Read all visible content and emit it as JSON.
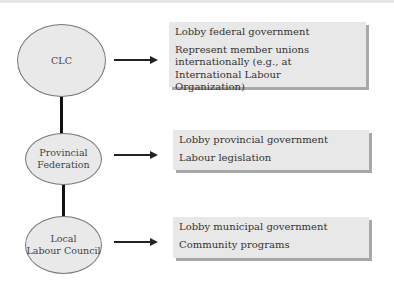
{
  "diagram": {
    "levels": [
      {
        "node": "CLC",
        "functions": [
          "Lobby federal government",
          "Represent member unions internationally (e.g., at International Labour Organization)"
        ]
      },
      {
        "node": "Provincial Federation",
        "node_lines": [
          "Provincial",
          "Federation"
        ],
        "functions": [
          "Lobby provincial government",
          "Labour legislation"
        ]
      },
      {
        "node": "Local Labour Council",
        "node_lines": [
          "Local",
          "Labour Council"
        ],
        "functions": [
          "Lobby municipal government",
          "Community programs"
        ]
      }
    ],
    "colors": {
      "node_fill": "#e9e9e9",
      "box_fill": "#e8e8e8",
      "box_shadow": "#a8a8a8",
      "connector": "#111111"
    }
  }
}
